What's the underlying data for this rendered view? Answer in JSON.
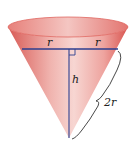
{
  "diagram": {
    "labels": {
      "radius_left": "r",
      "radius_right": "r",
      "height": "h",
      "slant": "2r"
    },
    "colors": {
      "cone_fill_light": "#f3c4c0",
      "cone_fill_dark": "#d9544f",
      "rim": "#e06660",
      "measure_lines": "#2d3e8f",
      "brace": "#333333"
    },
    "right_angle_marker": true
  }
}
